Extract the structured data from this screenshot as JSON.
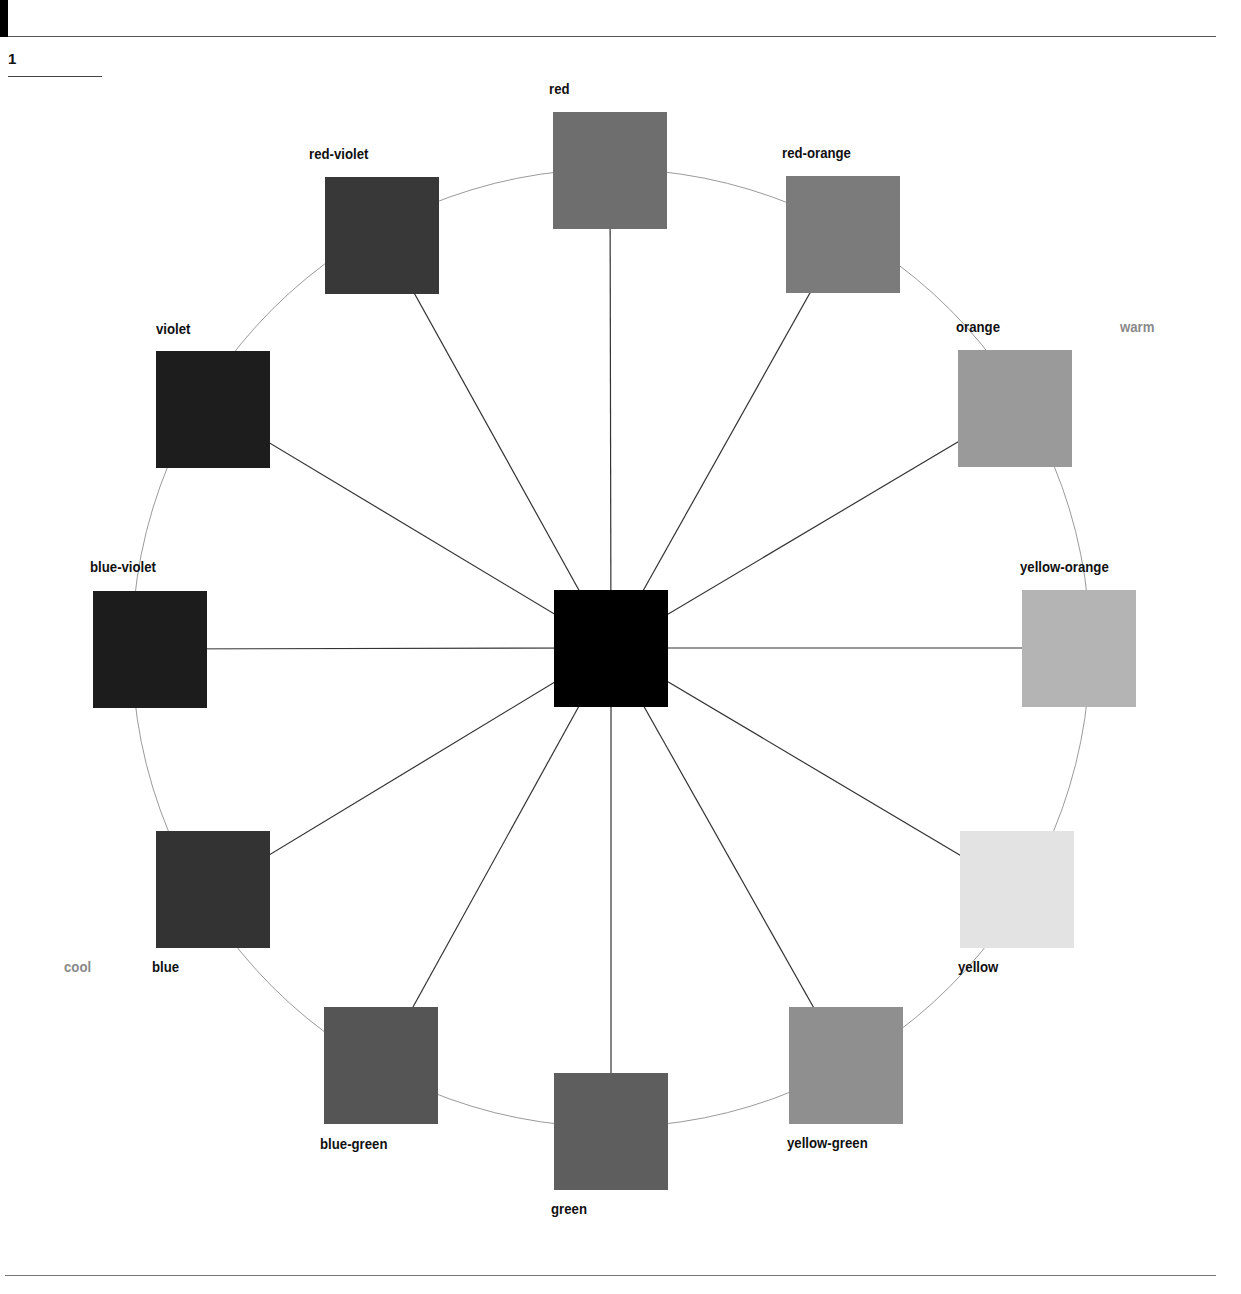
{
  "figure": {
    "number": "1"
  },
  "center": {
    "name": "center-swatch",
    "color": "#000000",
    "left": 554,
    "top": 590
  },
  "temperature_labels": {
    "warm": "warm",
    "cool": "cool"
  },
  "swatches": [
    {
      "name": "red",
      "label": "red",
      "color": "#6e6e6e",
      "left": 553,
      "top": 112,
      "label_left": 549,
      "label_top": 80
    },
    {
      "name": "red-orange",
      "label": "red-orange",
      "color": "#7b7b7b",
      "left": 786,
      "top": 176,
      "label_left": 782,
      "label_top": 144
    },
    {
      "name": "orange",
      "label": "orange",
      "color": "#9a9a9a",
      "left": 958,
      "top": 350,
      "label_left": 956,
      "label_top": 318
    },
    {
      "name": "yellow-orange",
      "label": "yellow-orange",
      "color": "#b4b4b4",
      "left": 1022,
      "top": 590,
      "label_left": 1020,
      "label_top": 558
    },
    {
      "name": "yellow",
      "label": "yellow",
      "color": "#e3e3e3",
      "left": 960,
      "top": 831,
      "label_left": 958,
      "label_top": 958
    },
    {
      "name": "yellow-green",
      "label": "yellow-green",
      "color": "#8f8f8f",
      "left": 789,
      "top": 1007,
      "label_left": 787,
      "label_top": 1134
    },
    {
      "name": "green",
      "label": "green",
      "color": "#5e5e5e",
      "left": 554,
      "top": 1073,
      "label_left": 551,
      "label_top": 1200
    },
    {
      "name": "blue-green",
      "label": "blue-green",
      "color": "#555555",
      "left": 324,
      "top": 1007,
      "label_left": 320,
      "label_top": 1135
    },
    {
      "name": "blue",
      "label": "blue",
      "color": "#333333",
      "left": 156,
      "top": 831,
      "label_left": 152,
      "label_top": 958
    },
    {
      "name": "blue-violet",
      "label": "blue-violet",
      "color": "#1c1c1c",
      "left": 93,
      "top": 591,
      "label_left": 90,
      "label_top": 558
    },
    {
      "name": "violet",
      "label": "violet",
      "color": "#1d1d1d",
      "left": 156,
      "top": 351,
      "label_left": 156,
      "label_top": 320
    },
    {
      "name": "red-violet",
      "label": "red-violet",
      "color": "#383838",
      "left": 325,
      "top": 177,
      "label_left": 309,
      "label_top": 145
    }
  ]
}
